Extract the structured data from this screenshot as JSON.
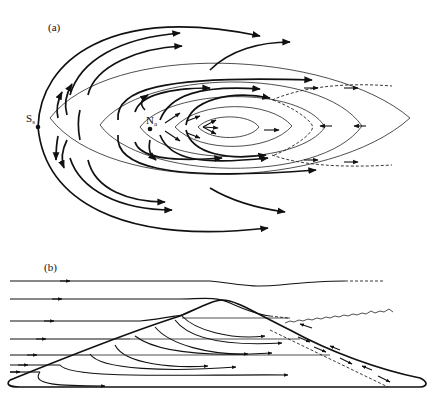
{
  "figure": {
    "panel_a": {
      "label": "(a)",
      "points": [
        {
          "name": "S",
          "subscript": "s",
          "x": 38,
          "y": 127
        },
        {
          "name": "N",
          "subscript": "a",
          "x": 150,
          "y": 129
        }
      ]
    },
    "panel_b": {
      "label": "(b)"
    }
  },
  "colors": {
    "ink": "#111111",
    "background": "#ffffff"
  }
}
